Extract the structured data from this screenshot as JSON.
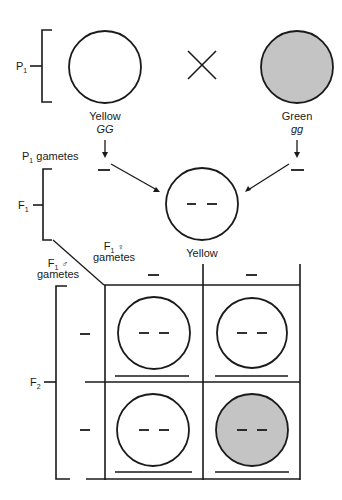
{
  "colors": {
    "yellow_fill": "#ffffff",
    "green_fill": "#c4c4c4",
    "line": "#1a1a1a"
  },
  "generations": {
    "p1": {
      "label": "P",
      "sub": "1"
    },
    "f1": {
      "label": "F",
      "sub": "1"
    },
    "f2": {
      "label": "F",
      "sub": "2"
    }
  },
  "cross_symbol": "×",
  "parents": [
    {
      "phenotype": "Yellow",
      "genotype": "GG",
      "fill": "yellow"
    },
    {
      "phenotype": "Green",
      "genotype": "gg",
      "fill": "green"
    }
  ],
  "p1_gametes": {
    "label": "P",
    "sub": "1",
    "suffix": " gametes"
  },
  "f1_offspring": {
    "phenotype": "Yellow"
  },
  "f1_female_gametes": {
    "label": "F",
    "sub": "1",
    "symbol": "♀",
    "line2": "gametes"
  },
  "f1_male_gametes": {
    "label": "F",
    "sub": "1",
    "symbol": "♂",
    "line2": "gametes"
  },
  "punnett": {
    "cells": [
      {
        "row": 0,
        "col": 0,
        "fill": "yellow"
      },
      {
        "row": 0,
        "col": 1,
        "fill": "yellow"
      },
      {
        "row": 1,
        "col": 0,
        "fill": "yellow"
      },
      {
        "row": 1,
        "col": 1,
        "fill": "green"
      }
    ]
  }
}
